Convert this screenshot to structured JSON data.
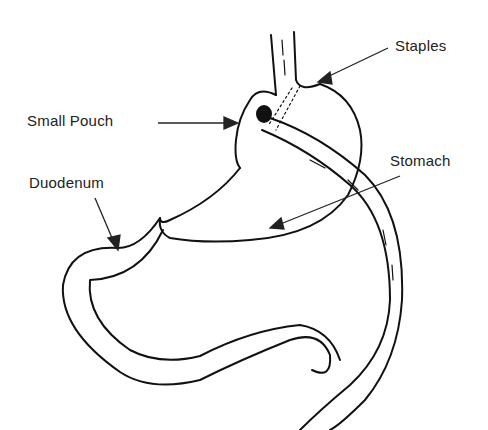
{
  "diagram": {
    "type": "anatomical-illustration",
    "labels": [
      {
        "id": "staples",
        "text": "Staples",
        "x": 395,
        "y": 37
      },
      {
        "id": "small_pouch",
        "text": "Small Pouch",
        "x": 27,
        "y": 110
      },
      {
        "id": "stomach",
        "text": "Stomach",
        "x": 390,
        "y": 150
      },
      {
        "id": "duodenum",
        "text": "Duodenum",
        "x": 29,
        "y": 172
      }
    ],
    "colors": {
      "ink": "#111111",
      "text": "#222222",
      "background": "#ffffff"
    }
  }
}
